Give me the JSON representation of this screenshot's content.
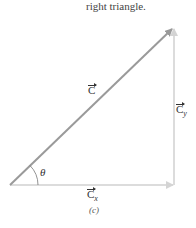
{
  "header": {
    "caption": "right triangle."
  },
  "diagram": {
    "vectors": [
      {
        "id": "C",
        "label": "C",
        "from": [
          10,
          185
        ],
        "to": [
          174,
          27
        ],
        "color": "#999999"
      },
      {
        "id": "Cx",
        "label": "C",
        "subscript": "x",
        "from": [
          10,
          185
        ],
        "to": [
          174,
          185
        ],
        "color": "#d9d9d9"
      },
      {
        "id": "Cy",
        "label": "C",
        "subscript": "y",
        "from": [
          174,
          185
        ],
        "to": [
          174,
          27
        ],
        "color": "#d9d9d9"
      }
    ],
    "angle_label": "θ",
    "figure_label": "(c)"
  },
  "labels": {
    "c": "C",
    "cx": "C",
    "cx_sub": "x",
    "cy": "C",
    "cy_sub": "y",
    "theta": "θ",
    "fig": "(c)"
  },
  "colors": {
    "hypotenuse": "#999999",
    "components": "#d9d9d9"
  }
}
